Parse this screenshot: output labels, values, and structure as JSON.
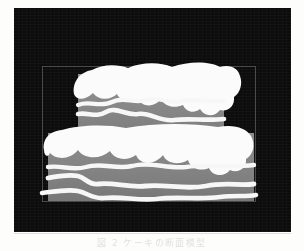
{
  "page": {
    "background_color": "#fdfdfc",
    "width": 304,
    "height": 251
  },
  "figure": {
    "name": "two-tier-frosted-cake-illustration",
    "alt_description": "Black rectangular plate containing a thin gray rectangular frame around a two-tier cake with dripping white frosting and wavy white icing lines",
    "panel": {
      "background_color": "#0c0c0c",
      "x": 14,
      "y": 8,
      "width": 277,
      "height": 224
    },
    "inner_frame": {
      "border_color": "#4a4a4a",
      "border_width_px": 1,
      "x": 42,
      "y": 66,
      "width": 214,
      "height": 136
    },
    "colors": {
      "cake_body": "#8a8a8a",
      "cake_body_shadow": "#6f6f6f",
      "frosting": "#fbfbfb",
      "icing_line": "#f7f7f7",
      "background": "#0c0c0c"
    },
    "tiers": [
      {
        "label": "upper-tier",
        "x": 78,
        "y": 74,
        "width": 146,
        "height": 66,
        "icing_line_count": 2
      },
      {
        "label": "lower-tier",
        "x": 48,
        "y": 133,
        "width": 206,
        "height": 68,
        "icing_line_count": 3
      }
    ]
  },
  "caption": {
    "text": "図 2  ケーキの断面模型",
    "color": "#c9c9c9",
    "visible": true,
    "note": "cropped and faded scan line"
  }
}
